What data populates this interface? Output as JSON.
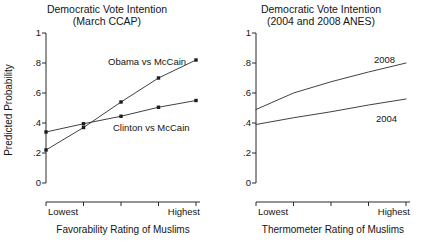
{
  "figure": {
    "ylabel": "Predicted Probability"
  },
  "panels": [
    {
      "id": "march-ccap",
      "title_line1": "Democratic Vote Intention",
      "title_line2": "(March CCAP)",
      "xlabel": "Favorability Rating of Muslims",
      "x_low_label": "Lowest",
      "x_high_label": "Highest",
      "ytick_labels": [
        "1",
        ".8",
        ".6",
        ".4",
        ".2",
        "0"
      ],
      "series_labels": [
        "Obama vs McCain",
        "Clinton vs McCain"
      ]
    },
    {
      "id": "anes",
      "title_line1": "Democratic Vote Intention",
      "title_line2": "(2004 and 2008 ANES)",
      "xlabel": "Thermometer Rating of Muslims",
      "x_low_label": "Lowest",
      "x_high_label": "Highest",
      "ytick_labels": [
        "1",
        ".8",
        ".6",
        ".4",
        ".2",
        "0"
      ],
      "series_labels": [
        "2008",
        "2004"
      ]
    }
  ],
  "chart_data": [
    {
      "type": "line",
      "title": "Democratic Vote Intention (March CCAP)",
      "xlabel": "Favorability Rating of Muslims",
      "ylabel": "Predicted Probability",
      "ylim": [
        0,
        1
      ],
      "yticks": [
        0,
        0.2,
        0.4,
        0.6,
        0.8,
        1
      ],
      "ytick_labels": [
        "0",
        ".2",
        ".4",
        ".6",
        ".8",
        "1"
      ],
      "x": [
        1,
        2,
        3,
        4,
        5
      ],
      "x_tick_labels": [
        "Lowest",
        "",
        "",
        "",
        "Highest"
      ],
      "markers": true,
      "grid": false,
      "legend": "inline-annotation",
      "series": [
        {
          "name": "Obama vs McCain",
          "values": [
            0.22,
            0.37,
            0.54,
            0.7,
            0.82
          ],
          "label_position": "above-right"
        },
        {
          "name": "Clinton vs McCain",
          "values": [
            0.34,
            0.395,
            0.445,
            0.505,
            0.55
          ],
          "label_position": "below-right"
        }
      ]
    },
    {
      "type": "line",
      "title": "Democratic Vote Intention (2004 and 2008 ANES)",
      "xlabel": "Thermometer Rating of Muslims",
      "ylabel": "Predicted Probability",
      "ylim": [
        0,
        1
      ],
      "yticks": [
        0,
        0.2,
        0.4,
        0.6,
        0.8,
        1
      ],
      "ytick_labels": [
        "0",
        ".2",
        ".4",
        ".6",
        ".8",
        "1"
      ],
      "x": [
        1,
        2,
        3,
        4,
        5
      ],
      "x_tick_labels": [
        "Lowest",
        "",
        "",
        "",
        "Highest"
      ],
      "markers": false,
      "grid": false,
      "legend": "inline-annotation",
      "series": [
        {
          "name": "2008",
          "values": [
            0.49,
            0.6,
            0.675,
            0.74,
            0.8
          ],
          "label_position": "above-right"
        },
        {
          "name": "2004",
          "values": [
            0.39,
            0.435,
            0.475,
            0.52,
            0.56
          ],
          "label_position": "above-right"
        }
      ]
    }
  ]
}
